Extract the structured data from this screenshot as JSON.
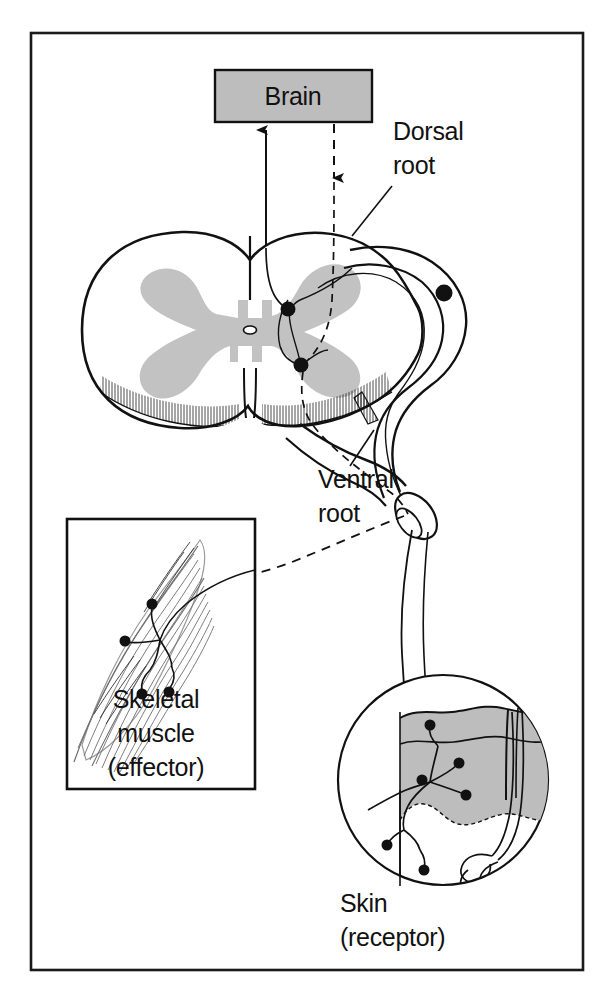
{
  "figure": {
    "type": "anatomical-diagram"
  },
  "colors": {
    "ink": "#111111",
    "gray_fill": "#bdbdbd",
    "gray_matter": "#c2c2c2",
    "epidermis": "#bdbdbd",
    "background": "#ffffff",
    "frame": "#1a1a1a"
  },
  "labels": {
    "brain": "Brain",
    "dorsal_root_line1": "Dorsal",
    "dorsal_root_line2": "root",
    "ventral_root_line1": "Ventral",
    "ventral_root_line2": "root",
    "muscle_line1": "Skeletal",
    "muscle_line2": "muscle",
    "muscle_line3": "(effector)",
    "skin_line1": "Skin",
    "skin_line2": "(receptor)"
  },
  "pathways": [
    {
      "name": "ascending-sensory-to-brain",
      "style": "solid",
      "arrow": "up",
      "from": "spinal cord gray matter",
      "to": "brain"
    },
    {
      "name": "descending-motor-from-brain",
      "style": "dashed",
      "arrow": "down",
      "from": "brain",
      "to": "spinal cord gray matter"
    },
    {
      "name": "sensory-afferent",
      "style": "solid",
      "arrow": "none",
      "from": "skin receptor",
      "to": "dorsal root ganglion"
    },
    {
      "name": "motor-efferent",
      "style": "dashed",
      "arrow": "none",
      "from": "ventral root",
      "to": "skeletal muscle"
    }
  ],
  "structures": [
    {
      "name": "brain-box",
      "shape": "rectangle",
      "fill": "gray"
    },
    {
      "name": "spinal-cord-cross-section",
      "shape": "oval",
      "fill": "white"
    },
    {
      "name": "gray-matter-butterfly",
      "shape": "butterfly",
      "fill": "gray"
    },
    {
      "name": "central-canal",
      "shape": "dot",
      "fill": "white"
    },
    {
      "name": "dorsal-root-ganglion",
      "shape": "cell-body-dot",
      "fill": "black"
    },
    {
      "name": "interneuron-cell-body",
      "shape": "cell-body-dot",
      "fill": "black"
    },
    {
      "name": "motor-neuron-cell-body",
      "shape": "cell-body-dot",
      "fill": "black"
    },
    {
      "name": "spinal-nerve-trunk",
      "shape": "cut-cylinder",
      "fill": "white"
    },
    {
      "name": "skeletal-muscle-inset",
      "shape": "rectangle-box",
      "fill": "white"
    },
    {
      "name": "skin-inset",
      "shape": "circle",
      "fill": "white"
    },
    {
      "name": "epidermis-layer",
      "shape": "band",
      "fill": "gray"
    },
    {
      "name": "sweat-gland-coil",
      "shape": "coil",
      "fill": "white"
    }
  ]
}
